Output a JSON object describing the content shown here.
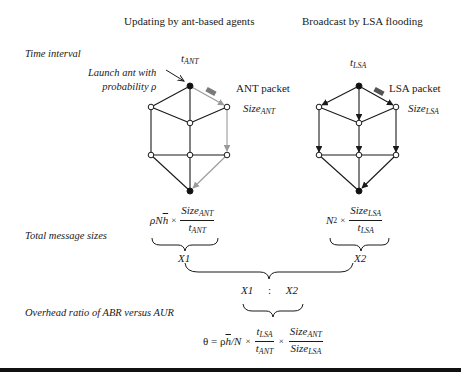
{
  "headers": {
    "left": "Updating by ant-based agents",
    "right": "Broadcast by LSA flooding"
  },
  "row_labels": {
    "time_interval": "Time interval",
    "total_message_sizes": "Total message sizes",
    "overhead_ratio": "Overhead ratio of ABR versus AUR"
  },
  "left_graph": {
    "time_label_base": "t",
    "time_label_sub": "ANT",
    "launch_note_line1": "Launch ant with",
    "launch_note_line2": "probability ρ",
    "packet_label": "ANT packet",
    "size_label_base": "Size",
    "size_label_sub": "ANT"
  },
  "right_graph": {
    "time_label_base": "t",
    "time_label_sub": "LSA",
    "packet_label": "LSA packet",
    "size_label_base": "Size",
    "size_label_sub": "LSA"
  },
  "formulas": {
    "x1": {
      "prefix": "ρN",
      "hbar": "h",
      "times": "×",
      "num_base": "Size",
      "num_sub": "ANT",
      "den_base": "t",
      "den_sub": "ANT",
      "label": "X1"
    },
    "x2": {
      "prefix": "N",
      "prefix_sup": "2",
      "times": "×",
      "num_base": "Size",
      "num_sub": "LSA",
      "den_base": "t",
      "den_sub": "LSA",
      "label": "X2"
    },
    "ratio": {
      "left": "X1",
      "colon": ":",
      "right": "X2"
    },
    "theta": {
      "lhs": "θ = ρ",
      "hbar": "h",
      "after_h": "/N",
      "times1": "×",
      "f1_num_base": "t",
      "f1_num_sub": "LSA",
      "f1_den_base": "t",
      "f1_den_sub": "ANT",
      "times2": "×",
      "f2_num_base": "Size",
      "f2_num_sub": "ANT",
      "f2_den_base": "Size",
      "f2_den_sub": "LSA"
    }
  },
  "colors": {
    "ink": "#1a1a1a",
    "ant_path": "#9a9a9a",
    "packet": "#7a7a7a"
  }
}
